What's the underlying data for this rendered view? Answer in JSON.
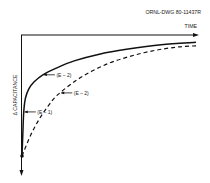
{
  "chart_data": {
    "type": "line",
    "title": "",
    "figure_id": "ORNL-DWG 80-11437R",
    "xlabel": "TIME",
    "ylabel": "Δ CAPACITANCE",
    "y_direction": "increasing-downward",
    "xlim": [
      0,
      1
    ],
    "ylim": [
      0,
      1
    ],
    "grid": false,
    "legend": "none",
    "series": [
      {
        "name": "solid",
        "style": "solid",
        "x": [
          0.0,
          0.005,
          0.01,
          0.02,
          0.04,
          0.07,
          0.12,
          0.2,
          0.3,
          0.45,
          0.6,
          0.8,
          1.0
        ],
        "y": [
          1.0,
          0.8,
          0.62,
          0.5,
          0.42,
          0.36,
          0.3,
          0.24,
          0.18,
          0.12,
          0.08,
          0.04,
          0.02
        ]
      },
      {
        "name": "dashed",
        "style": "dashed",
        "x": [
          0.0,
          0.05,
          0.1,
          0.15,
          0.2,
          0.3,
          0.4,
          0.5,
          0.6,
          0.7,
          0.8,
          0.9,
          1.0
        ],
        "y": [
          1.0,
          0.82,
          0.68,
          0.57,
          0.48,
          0.36,
          0.27,
          0.2,
          0.15,
          0.11,
          0.08,
          0.06,
          0.05
        ]
      }
    ],
    "annotations": [
      {
        "text": "(E – 2)",
        "series": "solid",
        "at_x": 0.12
      },
      {
        "text": "(E – 1)",
        "series": "solid",
        "at_x": 0.01
      },
      {
        "text": "(E – 2)",
        "series": "dashed",
        "at_x": 0.22
      }
    ]
  }
}
